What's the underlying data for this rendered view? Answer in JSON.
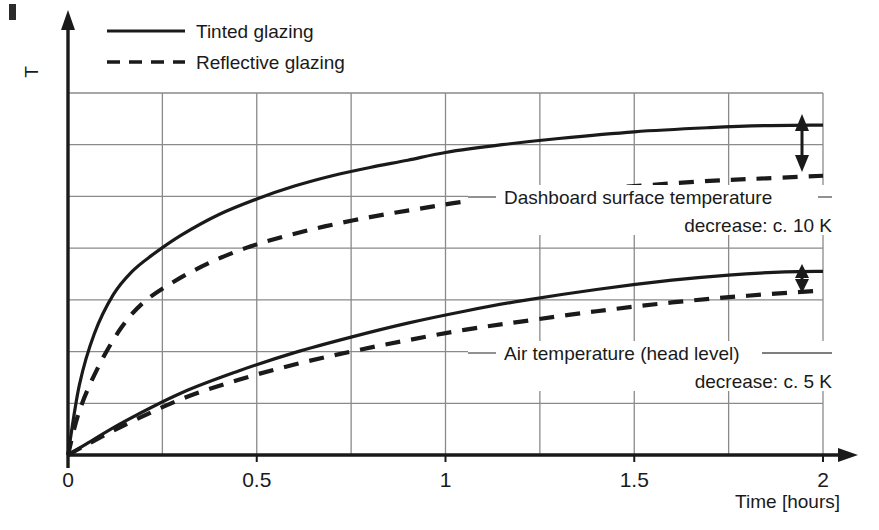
{
  "chart_data": {
    "type": "line",
    "title": "",
    "xlabel": "Time [hours]",
    "ylabel": "T",
    "xlim": [
      0,
      2
    ],
    "ylim": [
      0,
      7
    ],
    "x_ticks": [
      "0",
      "0.5",
      "1",
      "1.5",
      "2"
    ],
    "x_tick_values": [
      0,
      0.5,
      1,
      1.5,
      2
    ],
    "x_minor_gridlines": [
      0.25,
      0.75,
      1.25,
      1.75
    ],
    "y_gridline_count": 7,
    "grid": true,
    "y_axis_unlabeled": true,
    "legend_position": "top-left",
    "series": [
      {
        "name": "Dashboard surface temperature, tinted glazing",
        "style": "solid",
        "x": [
          0,
          0.03,
          0.07,
          0.12,
          0.17,
          0.22,
          0.3,
          0.4,
          0.5,
          0.6,
          0.7,
          0.8,
          0.9,
          1.0,
          1.15,
          1.3,
          1.5,
          1.7,
          1.85,
          2.0
        ],
        "y": [
          0,
          1.35,
          2.35,
          3.1,
          3.55,
          3.85,
          4.25,
          4.65,
          4.95,
          5.2,
          5.4,
          5.56,
          5.7,
          5.85,
          6.0,
          6.12,
          6.25,
          6.33,
          6.37,
          6.38
        ]
      },
      {
        "name": "Dashboard surface temperature, reflective glazing",
        "style": "dashed",
        "x": [
          0,
          0.03,
          0.08,
          0.14,
          0.2,
          0.28,
          0.37,
          0.47,
          0.57,
          0.68,
          0.8,
          0.92,
          1.05,
          1.2,
          1.35,
          1.5,
          1.7,
          1.85,
          2.0
        ],
        "y": [
          0,
          0.85,
          1.7,
          2.45,
          2.95,
          3.35,
          3.7,
          4.0,
          4.22,
          4.42,
          4.6,
          4.75,
          4.9,
          5.02,
          5.12,
          5.2,
          5.3,
          5.35,
          5.4
        ]
      },
      {
        "name": "Air temperature (head level), tinted glazing",
        "style": "solid",
        "x": [
          0,
          0.05,
          0.15,
          0.3,
          0.45,
          0.6,
          0.75,
          0.9,
          1.05,
          1.2,
          1.4,
          1.6,
          1.75,
          1.9,
          2.0
        ],
        "y": [
          0,
          0.22,
          0.65,
          1.2,
          1.62,
          1.98,
          2.28,
          2.55,
          2.78,
          2.98,
          3.2,
          3.38,
          3.48,
          3.54,
          3.55
        ]
      },
      {
        "name": "Air temperature (head level), reflective glazing",
        "style": "dashed",
        "x": [
          0,
          0.05,
          0.15,
          0.3,
          0.45,
          0.6,
          0.75,
          0.9,
          1.05,
          1.2,
          1.4,
          1.6,
          1.8,
          2.0
        ],
        "y": [
          0,
          0.2,
          0.58,
          1.08,
          1.45,
          1.75,
          2.0,
          2.22,
          2.42,
          2.58,
          2.78,
          2.95,
          3.08,
          3.18
        ]
      }
    ],
    "annotations": [
      {
        "id": "dashboard",
        "line1": "Dashboard surface temperature",
        "line2": "decrease: c. 10 K",
        "value_k": 10
      },
      {
        "id": "air",
        "line1": "Air temperature (head level)",
        "line2": "decrease: c. 5 K",
        "value_k": 5
      }
    ]
  },
  "legend": {
    "entries": [
      {
        "label": "Tinted glazing",
        "style": "solid"
      },
      {
        "label": "Reflective glazing",
        "style": "dashed"
      }
    ]
  },
  "axes": {
    "y_label": "T",
    "x_label": "Time [hours]"
  },
  "colors": {
    "curve": "#1a1a1a",
    "grid": "#8a8a8a",
    "axis": "#1a1a1a",
    "background": "#ffffff"
  }
}
